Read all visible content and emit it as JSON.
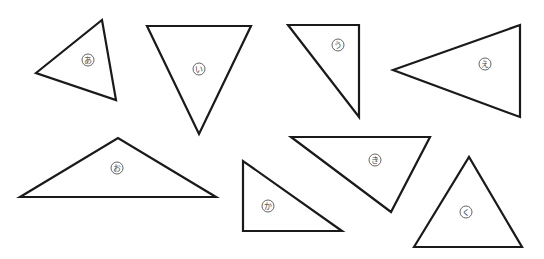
{
  "diagram": {
    "stroke_color": "#1a1a1a",
    "label_color": "#444444",
    "triangles": [
      {
        "label": "あ",
        "points": "36,73 102,20 116,100",
        "lx": 88,
        "ly": 60
      },
      {
        "label": "い",
        "points": "147,26 251,26 199,134",
        "lx": 199,
        "ly": 69
      },
      {
        "label": "う",
        "points": "288,25 359,25 359,117",
        "lx": 338,
        "ly": 45
      },
      {
        "label": "え",
        "points": "393,70 520,25 520,117",
        "lx": 485,
        "ly": 64
      },
      {
        "label": "お",
        "points": "20,197 118,138 216,197",
        "lx": 117,
        "ly": 168
      },
      {
        "label": "か",
        "points": "243,161 243,231 342,231",
        "lx": 268,
        "ly": 206
      },
      {
        "label": "き",
        "points": "291,137 430,137 391,212",
        "lx": 375,
        "ly": 160
      },
      {
        "label": "く",
        "points": "414,247 469,157 522,247",
        "lx": 466,
        "ly": 212
      }
    ]
  }
}
